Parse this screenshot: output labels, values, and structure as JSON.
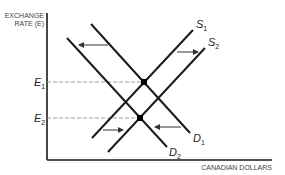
{
  "diagram": {
    "y_axis_title_line1": "EXCHANGE",
    "y_axis_title_line2": "RATE (E)",
    "x_axis_title": "CANADIAN DOLLARS",
    "curves": {
      "s1": {
        "label": "S",
        "sub": "1"
      },
      "s2": {
        "label": "S",
        "sub": "2"
      },
      "d1": {
        "label": "D",
        "sub": "1"
      },
      "d2": {
        "label": "D",
        "sub": "2"
      }
    },
    "levels": {
      "e1": {
        "label": "E",
        "sub": "1"
      },
      "e2": {
        "label": "E",
        "sub": "2"
      }
    },
    "colors": {
      "line": "#1a1a1a",
      "dashed": "#888888",
      "arrow": "#333333"
    }
  }
}
